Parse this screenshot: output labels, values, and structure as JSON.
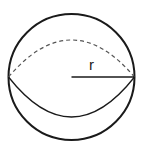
{
  "diagram": {
    "radius_label": "r",
    "colors": {
      "stroke": "#1a1a1a",
      "dashed": "#555555",
      "background": "#ffffff"
    }
  }
}
